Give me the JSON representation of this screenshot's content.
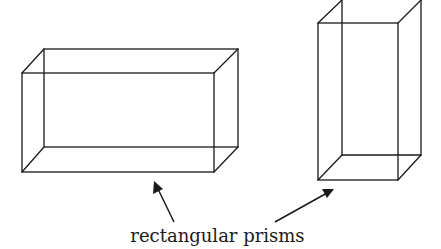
{
  "diagram": {
    "caption": "rectangular prisms",
    "stroke_color": "#1a1a1a",
    "background": "#ffffff",
    "prisms": [
      {
        "name": "wide-prism",
        "front": {
          "x1": 22,
          "y1": 73,
          "x2": 214,
          "y2": 172
        },
        "back": {
          "x1": 44,
          "y1": 49,
          "x2": 238,
          "y2": 147
        }
      },
      {
        "name": "tall-prism",
        "front": {
          "x1": 318,
          "y1": 23,
          "x2": 398,
          "y2": 180
        },
        "back": {
          "x1": 342,
          "y1": 0,
          "x2": 421,
          "y2": 155
        }
      }
    ],
    "arrows": [
      {
        "from": [
          174,
          222
        ],
        "to": [
          155,
          182
        ],
        "target": "wide-prism"
      },
      {
        "from": [
          275,
          222
        ],
        "to": [
          333,
          190
        ],
        "target": "tall-prism"
      }
    ]
  }
}
